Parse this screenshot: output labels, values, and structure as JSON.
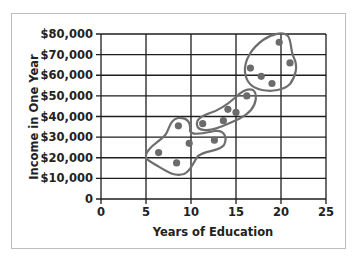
{
  "chart_data": {
    "type": "scatter",
    "title": "",
    "xlabel": "Years of Education",
    "ylabel": "Income in One Year",
    "xlim": [
      0,
      25
    ],
    "ylim": [
      0,
      80000
    ],
    "x_ticks": [
      0,
      5,
      10,
      15,
      20,
      25
    ],
    "x_tick_labels": [
      "0",
      "5",
      "10",
      "15",
      "20",
      "25"
    ],
    "y_ticks": [
      0,
      10000,
      20000,
      30000,
      40000,
      50000,
      60000,
      70000,
      80000
    ],
    "y_tick_labels": [
      "0",
      "$10,000",
      "$20,000",
      "$30,000",
      "$40,000",
      "$50,000",
      "$60,000",
      "$70,000",
      "$80,000"
    ],
    "grid": true,
    "legend": null,
    "points": [
      {
        "x": 6.4,
        "y": 22500,
        "cluster": 1
      },
      {
        "x": 8.4,
        "y": 17500,
        "cluster": 1
      },
      {
        "x": 8.6,
        "y": 35500,
        "cluster": 1
      },
      {
        "x": 9.8,
        "y": 27000,
        "cluster": 1
      },
      {
        "x": 12.6,
        "y": 28500,
        "cluster": 1
      },
      {
        "x": 11.3,
        "y": 36500,
        "cluster": 2
      },
      {
        "x": 13.6,
        "y": 38000,
        "cluster": 2
      },
      {
        "x": 14.1,
        "y": 43500,
        "cluster": 2
      },
      {
        "x": 15.0,
        "y": 42000,
        "cluster": 2
      },
      {
        "x": 16.2,
        "y": 50000,
        "cluster": 2
      },
      {
        "x": 16.6,
        "y": 63500,
        "cluster": 3
      },
      {
        "x": 17.8,
        "y": 59500,
        "cluster": 3
      },
      {
        "x": 19.0,
        "y": 56000,
        "cluster": 3
      },
      {
        "x": 19.8,
        "y": 76000,
        "cluster": 3
      },
      {
        "x": 21.0,
        "y": 66000,
        "cluster": 3
      }
    ],
    "annotations": [
      {
        "type": "cluster-outline",
        "cluster": 1,
        "description": "Hand-drawn loop around low-education / low-income points"
      },
      {
        "type": "cluster-outline",
        "cluster": 2,
        "description": "Hand-drawn loop around middle points"
      },
      {
        "type": "cluster-outline",
        "cluster": 3,
        "description": "Hand-drawn loop around high-education / high-income points"
      }
    ],
    "colors": {
      "grid": "#1e1e1e",
      "points": "#6b6b6b",
      "outline": "#6e6e6e",
      "frame": "#bdbdbd"
    }
  }
}
